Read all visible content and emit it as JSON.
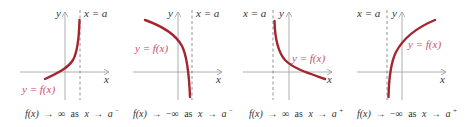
{
  "colors": {
    "curve": "#a3252f",
    "curve_label": "#c8506a",
    "axis": "#999999",
    "asymptote": "#777777",
    "text": "#333333"
  },
  "panels": [
    {
      "y_axis_label": "y",
      "x_axis_label": "x",
      "asymptote_label": "x = a",
      "curve_label": "y = f(x)",
      "caption": {
        "fx": "f(x)",
        "arrow1": "→",
        "limit": "∞",
        "as": "as",
        "x": "x",
        "arrow2": "→",
        "a": "a",
        "side": "−"
      }
    },
    {
      "y_axis_label": "y",
      "x_axis_label": "x",
      "asymptote_label": "x = a",
      "curve_label": "y = f(x)",
      "caption": {
        "fx": "f(x)",
        "arrow1": "→",
        "limit": "−∞",
        "as": "as",
        "x": "x",
        "arrow2": "→",
        "a": "a",
        "side": "−"
      }
    },
    {
      "y_axis_label": "y",
      "x_axis_label": "x",
      "asymptote_label": "x = a",
      "curve_label": "y = f(x)",
      "caption": {
        "fx": "f(x)",
        "arrow1": "→",
        "limit": "∞",
        "as": "as",
        "x": "x",
        "arrow2": "→",
        "a": "a",
        "side": "+"
      }
    },
    {
      "y_axis_label": "y",
      "x_axis_label": "x",
      "asymptote_label": "x = a",
      "curve_label": "y = f(x)",
      "caption": {
        "fx": "f(x)",
        "arrow1": "→",
        "limit": "−∞",
        "as": "as",
        "x": "x",
        "arrow2": "→",
        "a": "a",
        "side": "+"
      }
    }
  ]
}
